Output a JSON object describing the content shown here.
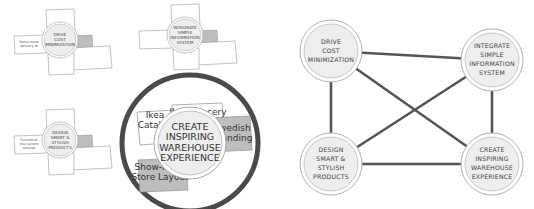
{
  "left_panel": {
    "small_clusters": [
      {
        "id": "cost",
        "center_lines": [
          "DRIVE",
          "COST",
          "MINIMIZATION"
        ],
        "side_note_lines": [
          "Some store",
          "delivery at"
        ]
      },
      {
        "id": "info",
        "center_lines": [
          "INTEGRATE",
          "SIMPLE",
          "INFORMATION",
          "SYSTEM"
        ],
        "side_note_lines": []
      },
      {
        "id": "design",
        "center_lines": [
          "DESIGN",
          "SMART &",
          "STYLISH",
          "PRODUCTS"
        ],
        "side_note_lines": [
          "Functional",
          "the current",
          "outside"
        ]
      }
    ],
    "zoom_cluster": {
      "center_lines": [
        "CREATE",
        "INSPIRING",
        "WAREHOUSE",
        "EXPERIENCE"
      ],
      "cards": [
        {
          "id": "catalog",
          "lines": [
            "Ikea",
            "Catalog"
          ],
          "shaded": false
        },
        {
          "id": "grocery",
          "lines": [
            "Ikea Grocery"
          ],
          "shaded": false
        },
        {
          "id": "branding",
          "lines": [
            "Swedish",
            "Branding"
          ],
          "shaded": true
        },
        {
          "id": "layout",
          "lines": [
            "Show-room",
            "Store Layout"
          ],
          "shaded": true
        }
      ]
    }
  },
  "right_panel": {
    "nodes": [
      {
        "id": "cost",
        "lines": [
          "DRIVE",
          "COST",
          "MINIMIZATION"
        ]
      },
      {
        "id": "info",
        "lines": [
          "INTEGRATE",
          "SIMPLE",
          "INFORMATION",
          "SYSTEM"
        ]
      },
      {
        "id": "design",
        "lines": [
          "DESIGN",
          "SMART &",
          "STYLISH",
          "PRODUCTS"
        ]
      },
      {
        "id": "experience",
        "lines": [
          "CREATE",
          "INSPIRING",
          "WAREHOUSE",
          "EXPERIENCE"
        ]
      }
    ],
    "edges": [
      [
        "cost",
        "info"
      ],
      [
        "cost",
        "design"
      ],
      [
        "cost",
        "experience"
      ],
      [
        "info",
        "design"
      ],
      [
        "info",
        "experience"
      ],
      [
        "design",
        "experience"
      ]
    ]
  },
  "colors": {
    "line": "#555555",
    "circle_fill": "#eeeeee",
    "circle_stroke": "#aaaaaa",
    "card_fill": "#ffffff",
    "card_shaded": "#bdbdbd",
    "card_stroke": "#999999",
    "zoom_ring": "#4a4a4a"
  }
}
